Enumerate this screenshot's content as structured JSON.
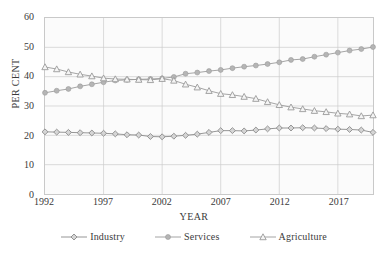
{
  "title_clipped": "",
  "axes": {
    "ylabel": "PER CENT",
    "xlabel": "YEAR",
    "yticks": [
      "0",
      "10",
      "20",
      "30",
      "40",
      "50",
      "60"
    ],
    "xticks": [
      "1992",
      "1997",
      "2002",
      "2007",
      "2012",
      "2017"
    ]
  },
  "legend": {
    "items": [
      {
        "label": "Industry",
        "marker": "diamond",
        "color": "#8a8a8a"
      },
      {
        "label": "Services",
        "marker": "circle",
        "color": "#9a9a9a"
      },
      {
        "label": "Agriculture",
        "marker": "triangle",
        "color": "#9a9a9a"
      }
    ]
  },
  "chart_data": {
    "type": "line",
    "title": "",
    "xlabel": "YEAR",
    "ylabel": "PER CENT",
    "xlim": [
      1992,
      2020
    ],
    "ylim": [
      0,
      60
    ],
    "ytick_step": 10,
    "xtick_values": [
      1992,
      1997,
      2002,
      2007,
      2012,
      2017
    ],
    "grid": true,
    "legend_position": "bottom",
    "x": [
      1992,
      1993,
      1994,
      1995,
      1996,
      1997,
      1998,
      1999,
      2000,
      2001,
      2002,
      2003,
      2004,
      2005,
      2006,
      2007,
      2008,
      2009,
      2010,
      2011,
      2012,
      2013,
      2014,
      2015,
      2016,
      2017,
      2018,
      2019,
      2020
    ],
    "series": [
      {
        "name": "Industry",
        "marker": "diamond",
        "color": "#8a8a8a",
        "values": [
          21.2,
          21.1,
          21.0,
          20.9,
          20.8,
          20.7,
          20.5,
          20.2,
          20.1,
          19.6,
          19.5,
          19.7,
          20.0,
          20.4,
          21.0,
          21.6,
          21.6,
          21.5,
          21.8,
          22.2,
          22.5,
          22.5,
          22.6,
          22.5,
          22.3,
          22.1,
          22.0,
          21.8,
          21.0
        ]
      },
      {
        "name": "Services",
        "marker": "circle",
        "color": "#9a9a9a",
        "values": [
          34.5,
          35.2,
          35.8,
          36.7,
          37.4,
          38.1,
          38.7,
          38.9,
          39.1,
          39.2,
          39.4,
          39.9,
          41.0,
          41.4,
          41.9,
          42.3,
          42.9,
          43.4,
          43.8,
          44.3,
          44.9,
          45.7,
          46.0,
          46.8,
          47.5,
          48.2,
          48.9,
          49.4,
          50.1
        ]
      },
      {
        "name": "Agriculture",
        "marker": "triangle",
        "color": "#9a9a9a",
        "values": [
          43.3,
          42.6,
          41.6,
          40.8,
          40.2,
          39.5,
          39.2,
          39.1,
          39.0,
          38.9,
          39.3,
          38.7,
          37.4,
          36.4,
          35.2,
          34.2,
          33.8,
          33.2,
          32.5,
          31.4,
          30.4,
          29.6,
          29.0,
          28.4,
          28.0,
          27.5,
          27.2,
          26.6,
          26.9
        ]
      }
    ]
  }
}
